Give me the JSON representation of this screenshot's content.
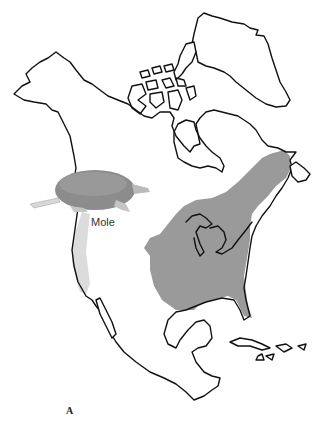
{
  "figure": {
    "panel_label": "A",
    "annotations": [
      {
        "label": "Mole",
        "position": "west coast, below mole illustration"
      }
    ]
  },
  "map": {
    "region": "North America",
    "colors": {
      "eastern_range": "#9a9a9a",
      "western_range": "#dcdcdc",
      "coastline": "#111111",
      "mole_body": "#8c8c8c",
      "background": "#ffffff"
    },
    "ranges": [
      {
        "name": "eastern-range",
        "description": "Eastern North America shaded dark gray"
      },
      {
        "name": "western-range",
        "description": "Pacific coast strip shaded light gray"
      }
    ]
  }
}
